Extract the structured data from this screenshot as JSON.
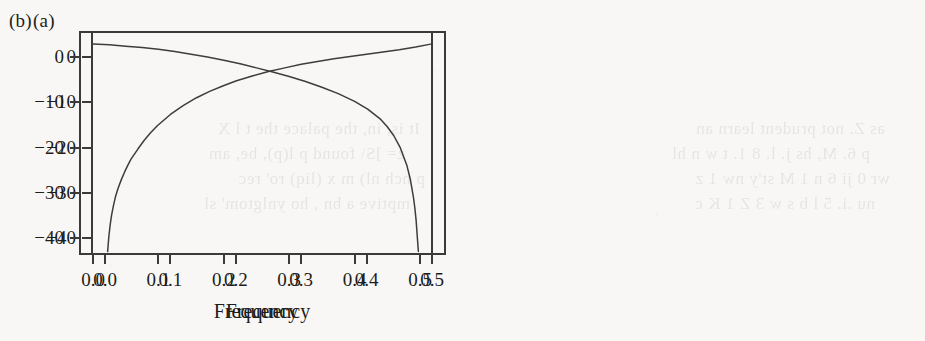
{
  "figure": {
    "paper_color": "#f8f7f5",
    "ink_color": "#1d1d1b",
    "axis_color": "#3a3a38",
    "curve_color": "#3d3d3b"
  },
  "ghost_text": {
    "note": "faint show-through of text printed on the reverse side of the scanned page",
    "lines": [
      "as Z. not prudent learn an",
      "p 6. M, hs j. l. 8 1. t w n hl",
      "wr 0 ji 6 n 1 M st'y nw 1 z",
      "nu .i. 5 l b s w 3 Z 1 K c",
      "It is, in, the palace the t l X",
      "z= ]S\\ found p l(p), be, am",
      "p nch nl) m x (liq) ro' rec",
      "mptive a bn , ho ynlgtom' sl"
    ]
  },
  "panels": [
    {
      "id": "a",
      "tag": "(a)",
      "chart_index": 0
    },
    {
      "id": "b",
      "tag": "(b)",
      "chart_index": 1
    }
  ],
  "chart_data": [
    {
      "type": "line",
      "panel": "(a)",
      "title": "",
      "xlabel": "Frequency",
      "ylabel": "",
      "xlim": [
        0.0,
        0.5
      ],
      "ylim": [
        -44,
        5
      ],
      "xticks": [
        0.0,
        0.1,
        0.2,
        0.3,
        0.4,
        0.5
      ],
      "xticklabels": [
        "0.0",
        "0.1",
        "0.2",
        "0.3",
        "0.4",
        "0.5"
      ],
      "yticks": [
        0,
        -10,
        -20,
        -30,
        -40
      ],
      "yticklabels": [
        "0",
        "-10",
        "-20",
        "-30",
        "-40"
      ],
      "grid": false,
      "legend": false,
      "description": "high-pass (first-difference) spectral gain in decibels; rises steeply from about -43 dB near frequency 0 and flattens near +3 dB at frequency 0.5",
      "series": [
        {
          "name": "spectrum-a",
          "x": [
            0.004,
            0.006,
            0.008,
            0.01,
            0.013,
            0.016,
            0.02,
            0.025,
            0.03,
            0.035,
            0.04,
            0.05,
            0.06,
            0.07,
            0.08,
            0.1,
            0.12,
            0.14,
            0.16,
            0.18,
            0.2,
            0.225,
            0.25,
            0.275,
            0.3,
            0.325,
            0.35,
            0.375,
            0.4,
            0.425,
            0.45,
            0.475,
            0.5
          ],
          "y": [
            -43.0,
            -39.5,
            -37.0,
            -35.0,
            -32.8,
            -30.9,
            -29.0,
            -27.1,
            -25.4,
            -23.9,
            -22.5,
            -20.4,
            -18.4,
            -16.7,
            -15.2,
            -12.7,
            -10.7,
            -9.0,
            -7.6,
            -6.4,
            -5.3,
            -4.2,
            -3.2,
            -2.4,
            -1.6,
            -1.0,
            -0.4,
            0.1,
            0.6,
            1.1,
            1.6,
            2.2,
            2.9
          ]
        }
      ]
    },
    {
      "type": "line",
      "panel": "(b)",
      "title": "",
      "xlabel": "Frequency",
      "ylabel": "",
      "xlim": [
        0.0,
        0.5
      ],
      "ylim": [
        -44,
        5
      ],
      "xticks": [
        0.0,
        0.1,
        0.2,
        0.3,
        0.4,
        0.5
      ],
      "xticklabels": [
        "0.0",
        "0.1",
        "0.2",
        "0.3",
        "0.4",
        "0.5"
      ],
      "yticks": [
        0,
        -10,
        -20,
        -30,
        -40
      ],
      "yticklabels": [
        "0",
        "-10",
        "-20",
        "-30",
        "-40"
      ],
      "grid": false,
      "legend": false,
      "description": "low-pass (summation) spectral gain in decibels; flat near +3 dB at frequency 0 and falls steeply to about -43 dB at frequency 0.5",
      "series": [
        {
          "name": "spectrum-b",
          "x": [
            0.0,
            0.025,
            0.05,
            0.075,
            0.1,
            0.125,
            0.15,
            0.175,
            0.2,
            0.225,
            0.25,
            0.275,
            0.3,
            0.325,
            0.35,
            0.375,
            0.4,
            0.42,
            0.44,
            0.45,
            0.46,
            0.47,
            0.48,
            0.485,
            0.49,
            0.492,
            0.494,
            0.496,
            0.4975
          ],
          "y": [
            2.9,
            2.7,
            2.4,
            2.1,
            1.7,
            1.2,
            0.6,
            0.0,
            -0.7,
            -1.5,
            -2.4,
            -3.3,
            -4.3,
            -5.4,
            -6.7,
            -8.1,
            -9.8,
            -11.5,
            -13.8,
            -15.4,
            -17.4,
            -20.1,
            -24.0,
            -26.9,
            -31.0,
            -33.2,
            -36.0,
            -40.0,
            -43.0
          ]
        }
      ]
    }
  ]
}
